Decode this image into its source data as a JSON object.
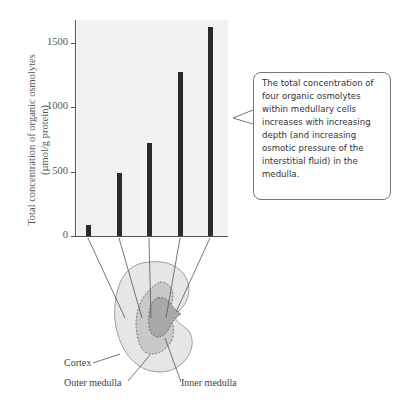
{
  "chart_data": {
    "type": "bar",
    "title": "",
    "xlabel": "",
    "ylabel": "Total concentration of organic osmolytes (µmol/g protein)",
    "ylabel_line1": "Total concentration of organic osmolytes",
    "ylabel_line2": "(µmol/g protein)",
    "ylim": [
      0,
      1680
    ],
    "yticks": [
      "0",
      "500",
      "1000",
      "1500"
    ],
    "categories": [
      "Cortex",
      "Outer medulla (outer)",
      "Outer medulla (inner)",
      "Inner medulla (outer)",
      "Inner medulla (tip)"
    ],
    "values": [
      85,
      490,
      720,
      1270,
      1620
    ],
    "grid": false,
    "legend": null
  },
  "callout": {
    "text": "The total concentration of four organic osmolytes within medullary cells increases with increasing depth (and increasing osmotic pressure of the interstitial fluid) in the medulla."
  },
  "kidney": {
    "labels": {
      "cortex": "Cortex",
      "outer_medulla": "Outer medulla",
      "inner_medulla": "Inner medulla"
    },
    "colors": {
      "cortex": "#e6e6e6",
      "outer_medulla": "#c8c8c8",
      "inner_medulla": "#a9a9a9"
    }
  }
}
